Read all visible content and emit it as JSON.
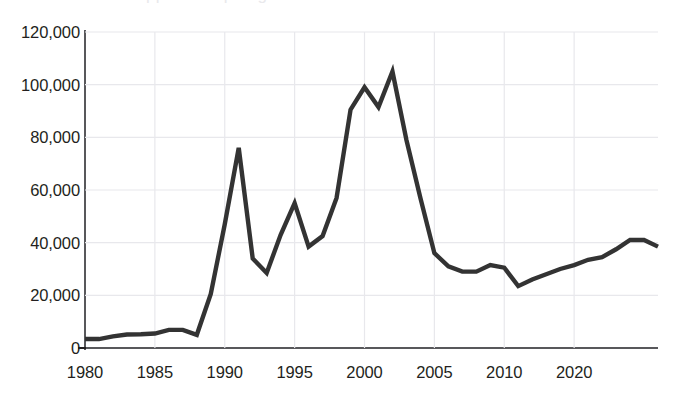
{
  "chart_data": {
    "type": "line",
    "title": "",
    "subtitle": "",
    "xlabel": "",
    "ylabel": "",
    "ylim": [
      0,
      120000
    ],
    "ytick_values": [
      0,
      20000,
      40000,
      60000,
      80000,
      100000,
      120000
    ],
    "ytick_labels": [
      "0",
      "20,000",
      "40,000",
      "60,000",
      "80,000",
      "100,000",
      "120,000"
    ],
    "xtick_labels": [
      "1980",
      "1985",
      "1990",
      "1995",
      "2000",
      "2005",
      "2010",
      "2020"
    ],
    "xtick_indices": [
      0,
      5,
      10,
      15,
      20,
      25,
      30,
      35
    ],
    "grid": "both-light",
    "legend": "none",
    "line_color": "#333333",
    "grid_color": "#e8e8ec",
    "axis_color": "#58585b",
    "text_color": "#231f20",
    "x": [
      1980,
      1981,
      1982,
      1983,
      1984,
      1985,
      1986,
      1987,
      1988,
      1989,
      1990,
      1991,
      1992,
      1993,
      1994,
      1995,
      1996,
      1997,
      1998,
      1999,
      2000,
      2001,
      2002,
      2003,
      2004,
      2005,
      2006,
      2007,
      2008,
      2009,
      2010,
      2011,
      2012,
      2013,
      2014,
      2015,
      2016,
      2017,
      2018,
      2019,
      2020,
      2021
    ],
    "series": [
      {
        "name": "Value",
        "values": [
          3400,
          3400,
          4400,
          5100,
          5200,
          5500,
          6900,
          6900,
          5000,
          20500,
          47000,
          76000,
          34000,
          28500,
          43000,
          55000,
          38500,
          42500,
          57000,
          90500,
          99000,
          91500,
          105000,
          79000,
          57000,
          36000,
          31000,
          29000,
          29000,
          31500,
          30500,
          23500,
          26000,
          28000,
          30000,
          31500,
          33500,
          34500,
          37500,
          41000,
          41000,
          38500
        ]
      }
    ]
  },
  "y_axis": {
    "labels": [
      {
        "text": "120,000",
        "value": 120000
      },
      {
        "text": "100,000",
        "value": 100000
      },
      {
        "text": "80,000",
        "value": 80000
      },
      {
        "text": "60,000",
        "value": 60000
      },
      {
        "text": "40,000",
        "value": 40000
      },
      {
        "text": "20,000",
        "value": 20000
      },
      {
        "text": "0",
        "value": 0
      }
    ]
  },
  "x_axis": {
    "labels": [
      {
        "text": "1980",
        "index": 0
      },
      {
        "text": "1985",
        "index": 5
      },
      {
        "text": "1990",
        "index": 10
      },
      {
        "text": "1995",
        "index": 15
      },
      {
        "text": "2000",
        "index": 20
      },
      {
        "text": "2005",
        "index": 25
      },
      {
        "text": "2010",
        "index": 30
      },
      {
        "text": "2020",
        "index": 35
      }
    ]
  },
  "title_sliver": {
    "text": "Chart title cropped at top edge"
  }
}
